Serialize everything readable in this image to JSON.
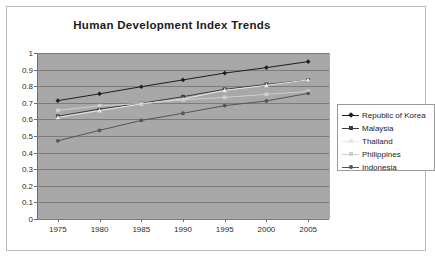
{
  "chart_data": {
    "type": "line",
    "title": "Human Development Index Trends",
    "xlabel": "",
    "ylabel": "",
    "x": [
      1975,
      1980,
      1985,
      1990,
      1995,
      2000,
      2005
    ],
    "categories": [
      "1975",
      "1980",
      "1985",
      "1990",
      "1995",
      "2000",
      "2005"
    ],
    "ylim": [
      0,
      1
    ],
    "ytick_labels": [
      "0",
      "0.1",
      "0.2",
      "0.3",
      "0.4",
      "0.5",
      "0.6",
      "0.7",
      "0.8",
      "0.9",
      "1"
    ],
    "ytick_values": [
      0,
      0.1,
      0.2,
      0.3,
      0.4,
      0.5,
      0.6,
      0.7,
      0.8,
      0.9,
      1
    ],
    "grid": true,
    "legend_position": "right",
    "plot_background": "#a8a8a8",
    "series": [
      {
        "name": "Republic of Korea",
        "color": "#1e1e1e",
        "marker": "diamond",
        "values": [
          0.713,
          0.754,
          0.797,
          0.838,
          0.879,
          0.912,
          0.948
        ]
      },
      {
        "name": "Malaysia",
        "color": "#3d3d3d",
        "marker": "square",
        "values": [
          0.619,
          0.662,
          0.697,
          0.737,
          0.781,
          0.811,
          0.837
        ]
      },
      {
        "name": "Thailand",
        "color": "#e8e8e8",
        "marker": "triangle",
        "values": [
          0.612,
          0.653,
          0.693,
          0.723,
          0.775,
          0.805,
          0.838
        ]
      },
      {
        "name": "Philippines",
        "color": "#cfcfcf",
        "marker": "cross",
        "values": [
          0.654,
          0.682,
          0.695,
          0.718,
          0.733,
          0.751,
          0.768
        ]
      },
      {
        "name": "Indonesia",
        "color": "#555555",
        "marker": "circle",
        "values": [
          0.471,
          0.534,
          0.594,
          0.637,
          0.683,
          0.711,
          0.757
        ]
      }
    ]
  }
}
